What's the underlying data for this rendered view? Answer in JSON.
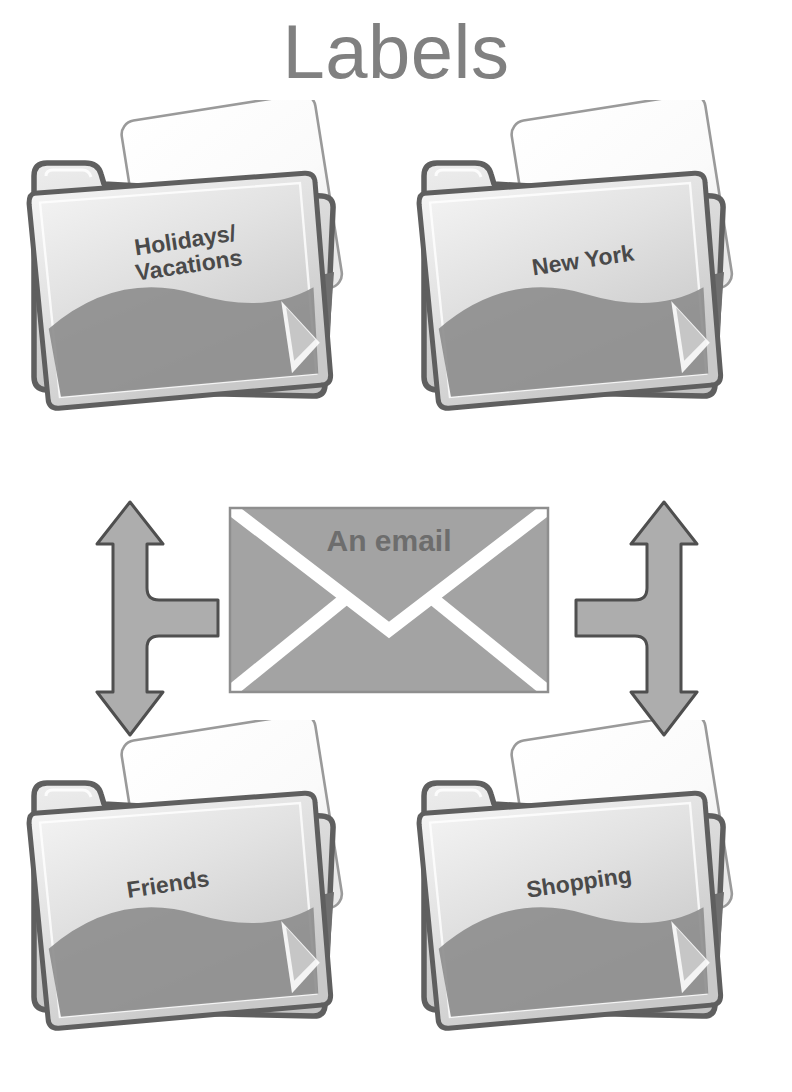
{
  "title": "Labels",
  "envelope": {
    "label": "An email",
    "icon": "envelope-icon",
    "fill": "#a3a3a3",
    "stroke": "#8a8a8a",
    "flap": "#ffffff",
    "text_color": "#6d6d6d"
  },
  "arrows": {
    "left": {
      "icon": "fork-arrow-up-down-right-icon",
      "directions": "up-down-right",
      "fill": "#adadad",
      "stroke": "#4f4f4f"
    },
    "right": {
      "icon": "fork-arrow-up-down-left-icon",
      "directions": "up-down-left",
      "fill": "#adadad",
      "stroke": "#4f4f4f"
    }
  },
  "folders": [
    {
      "id": "holidays",
      "label": "Holidays/\nVacations",
      "icon": "folder-with-document-icon",
      "position": "top-left"
    },
    {
      "id": "newyork",
      "label": "New York",
      "icon": "folder-with-document-icon",
      "position": "top-right"
    },
    {
      "id": "friends",
      "label": "Friends",
      "icon": "folder-with-document-icon",
      "position": "bottom-left"
    },
    {
      "id": "shopping",
      "label": "Shopping",
      "icon": "folder-with-document-icon",
      "position": "bottom-right"
    }
  ],
  "colors": {
    "title": "#808080",
    "folder_front_light": "#eeeeee",
    "folder_front_mid": "#d2d2d2",
    "folder_shadow": "#8e8e8e",
    "folder_outline": "#5f5f5f",
    "paper": "#fdfdfd",
    "paper_outline": "#9a9a9a",
    "caption": "#4a4a4a",
    "background": "#ffffff"
  }
}
